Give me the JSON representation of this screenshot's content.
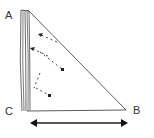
{
  "diagram": {
    "vertices": [
      {
        "id": "A",
        "label": "A",
        "x": 27,
        "y": 10
      },
      {
        "id": "B",
        "label": "B",
        "x": 126,
        "y": 110
      },
      {
        "id": "C",
        "label": "C",
        "x": 22,
        "y": 111
      }
    ],
    "edges": [
      {
        "from": "A",
        "to": "B",
        "style": "thin line"
      },
      {
        "from": "C",
        "to": "B",
        "style": "thin line"
      },
      {
        "from": "A",
        "to": "C",
        "style": "thick multi-stroke"
      }
    ],
    "dashed_arrows": [
      {
        "from": [
          57,
          42
        ],
        "to": [
          40,
          34
        ],
        "note": "dashed line with arrowhead toward AC side"
      },
      {
        "from": [
          48,
          56
        ],
        "to": [
          32,
          48
        ]
      },
      {
        "from": [
          40,
          73
        ],
        "to": [
          62,
          69
        ],
        "note": "ends with dot"
      },
      {
        "from": [
          34,
          88
        ],
        "to": [
          50,
          96
        ],
        "note": "ends with dot"
      }
    ],
    "double_arrow": {
      "from": [
        32,
        123
      ],
      "to": [
        127,
        123
      ],
      "meaning": "horizontal motion / base length"
    },
    "stroke_color": "#222222"
  }
}
